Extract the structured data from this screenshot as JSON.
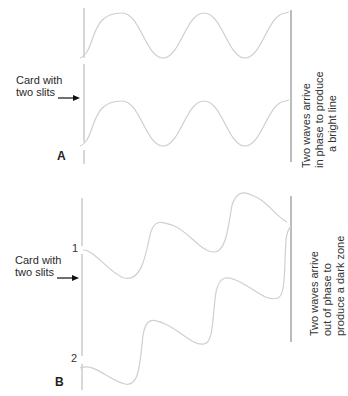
{
  "panel_a": {
    "letter": "A",
    "card_label_line1": "Card with",
    "card_label_line2": "two slits",
    "result_line1": "Two waves arrive",
    "result_line2": "in phase to produce",
    "result_line3": "a bright line"
  },
  "panel_b": {
    "letter": "B",
    "slit_1": "1",
    "slit_2": "2",
    "card_label_line1": "Card with",
    "card_label_line2": "two slits",
    "result_line1": "Two waves arrive",
    "result_line2": "out of phase to",
    "result_line3": "produce a dark zone"
  },
  "colors": {
    "wave": "#c8c8c8",
    "line": "#9a9a9a",
    "arrow": "#111111"
  }
}
